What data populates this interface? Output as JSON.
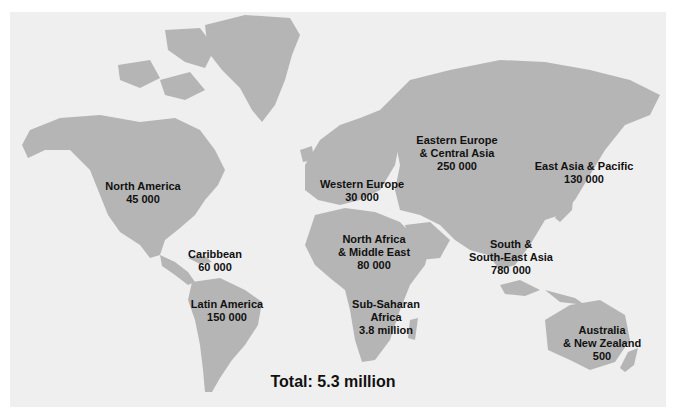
{
  "map": {
    "title": "Regional estimates",
    "colors": {
      "background": "#efefef",
      "land": "#b5b5b5",
      "text": "#111111",
      "border": "#ffffff"
    },
    "regions": [
      {
        "id": "north-america",
        "lines": [
          "North America",
          "45 000"
        ],
        "x": 143,
        "y": 180
      },
      {
        "id": "caribbean",
        "lines": [
          "Caribbean",
          "60 000"
        ],
        "x": 215,
        "y": 248
      },
      {
        "id": "latin-america",
        "lines": [
          "Latin America",
          "150 000"
        ],
        "x": 227,
        "y": 298
      },
      {
        "id": "western-europe",
        "lines": [
          "Western Europe",
          "30 000"
        ],
        "x": 362,
        "y": 178
      },
      {
        "id": "eastern-europe-central-asia",
        "lines": [
          "Eastern Europe",
          "& Central Asia",
          "250 000"
        ],
        "x": 457,
        "y": 134
      },
      {
        "id": "east-asia-pacific",
        "lines": [
          "East Asia & Pacific",
          "130 000"
        ],
        "x": 584,
        "y": 160
      },
      {
        "id": "north-africa-middle-east",
        "lines": [
          "North Africa",
          "& Middle East",
          "80 000"
        ],
        "x": 374,
        "y": 233
      },
      {
        "id": "south-southeast-asia",
        "lines": [
          "South &",
          "South-East Asia",
          "780 000"
        ],
        "x": 511,
        "y": 238
      },
      {
        "id": "sub-saharan-africa",
        "lines": [
          "Sub-Saharan",
          "Africa",
          "3.8 million"
        ],
        "x": 386,
        "y": 298
      },
      {
        "id": "australia-new-zealand",
        "lines": [
          "Australia",
          "& New Zealand",
          "500"
        ],
        "x": 602,
        "y": 324
      }
    ],
    "total": "Total: 5.3 million"
  }
}
